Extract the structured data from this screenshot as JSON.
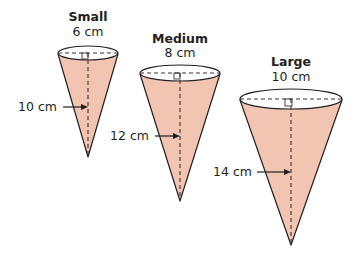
{
  "diagram": {
    "type": "three cones with labeled diameter and height",
    "colors": {
      "fill": "#f2c4b2",
      "outline": "#231f20",
      "dashed": "#3d302c",
      "top": "#ffffff"
    },
    "cones": [
      {
        "name": "Small",
        "diameter_label": "6 cm",
        "height_label": "10 cm"
      },
      {
        "name": "Medium",
        "diameter_label": "8 cm",
        "height_label": "12 cm"
      },
      {
        "name": "Large",
        "diameter_label": "10 cm",
        "height_label": "14 cm"
      }
    ]
  }
}
